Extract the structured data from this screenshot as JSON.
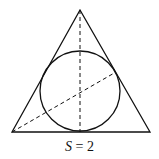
{
  "figure": {
    "caption_variable": "S",
    "caption_equals": "=",
    "caption_value": "2",
    "shapes": {
      "triangle": {
        "type": "equilateral-triangle",
        "vertices": [
          [
            80,
            10
          ],
          [
            12,
            132
          ],
          [
            150,
            132
          ]
        ]
      },
      "incircle": {
        "cx": 80,
        "cy": 91,
        "r": 40
      },
      "dashed_lines": [
        {
          "name": "altitude",
          "from": [
            80,
            10
          ],
          "to": [
            80,
            132
          ]
        },
        {
          "name": "angle-bisector",
          "from": [
            12,
            132
          ],
          "to": [
            116,
            72
          ]
        }
      ]
    },
    "colors": {
      "stroke": "#111111",
      "background": "#ffffff"
    }
  }
}
